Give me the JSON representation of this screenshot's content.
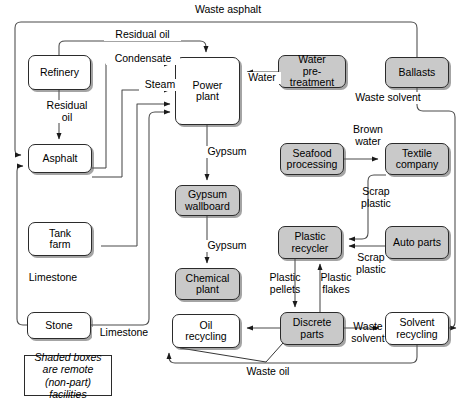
{
  "diagram": {
    "legend_text": "Shaded boxes are remote (non-part) facilities",
    "colors": {
      "shaded_fill": "#c9c9c9",
      "plain_fill": "#ffffff",
      "stroke": "#2b2b2b",
      "text": "#000000",
      "background": "#ffffff"
    },
    "nodes": [
      {
        "id": "refinery",
        "label": "Refinery",
        "shaded": false,
        "x": 28,
        "y": 55,
        "w": 63,
        "h": 35
      },
      {
        "id": "asphalt",
        "label": "Asphalt",
        "shaded": false,
        "x": 28,
        "y": 144,
        "w": 64,
        "h": 29
      },
      {
        "id": "tank_farm",
        "label": "Tank\nfarm",
        "shaded": false,
        "x": 28,
        "y": 222,
        "w": 64,
        "h": 34
      },
      {
        "id": "stone",
        "label": "Stone",
        "shaded": false,
        "x": 27,
        "y": 312,
        "w": 64,
        "h": 27
      },
      {
        "id": "power_plant",
        "label": "Power\nplant",
        "shaded": false,
        "x": 175,
        "y": 57,
        "w": 65,
        "h": 68
      },
      {
        "id": "gypsum_wallboard",
        "label": "Gypsum\nwallboard",
        "shaded": true,
        "x": 175,
        "y": 185,
        "w": 65,
        "h": 31
      },
      {
        "id": "chemical_plant",
        "label": "Chemical\nplant",
        "shaded": true,
        "x": 175,
        "y": 268,
        "w": 65,
        "h": 32
      },
      {
        "id": "oil_recycling",
        "label": "Oil\nrecycling",
        "shaded": false,
        "x": 172,
        "y": 314,
        "w": 68,
        "h": 34
      },
      {
        "id": "water_pre",
        "label": "Water\npre-treatment",
        "shaded": true,
        "x": 278,
        "y": 55,
        "w": 68,
        "h": 33
      },
      {
        "id": "ballasts",
        "label": "Ballasts",
        "shaded": true,
        "x": 385,
        "y": 57,
        "w": 64,
        "h": 31
      },
      {
        "id": "seafood",
        "label": "Seafood\nprocessing",
        "shaded": true,
        "x": 280,
        "y": 143,
        "w": 64,
        "h": 32
      },
      {
        "id": "textile",
        "label": "Textile\ncompany",
        "shaded": true,
        "x": 385,
        "y": 143,
        "w": 64,
        "h": 32
      },
      {
        "id": "plastic_rec",
        "label": "Plastic\nrecycler",
        "shaded": true,
        "x": 278,
        "y": 226,
        "w": 64,
        "h": 33
      },
      {
        "id": "auto_parts",
        "label": "Auto parts",
        "shaded": true,
        "x": 385,
        "y": 226,
        "w": 64,
        "h": 33
      },
      {
        "id": "discrete_parts",
        "label": "Discrete\nparts",
        "shaded": true,
        "x": 280,
        "y": 312,
        "w": 64,
        "h": 33
      },
      {
        "id": "solvent_rec",
        "label": "Solvent\nrecycling",
        "shaded": false,
        "x": 385,
        "y": 312,
        "w": 64,
        "h": 33
      }
    ],
    "flow_labels": [
      {
        "id": "waste_asphalt",
        "text": "Waste asphalt",
        "x": 182,
        "y": 4,
        "w": 90
      },
      {
        "id": "residual_oil_top",
        "text": "Residual oil",
        "x": 104,
        "y": 29,
        "w": 75
      },
      {
        "id": "condensate",
        "text": "Condensate",
        "x": 106,
        "y": 53,
        "w": 72
      },
      {
        "id": "steam",
        "text": "Steam",
        "x": 139,
        "y": 79,
        "w": 40
      },
      {
        "id": "water",
        "text": "Water",
        "x": 243,
        "y": 72,
        "w": 36
      },
      {
        "id": "residual_oil_v",
        "text": "Residual\noil",
        "x": 41,
        "y": 100,
        "w": 50
      },
      {
        "id": "waste_solvent_t",
        "text": "Waste solvent",
        "x": 344,
        "y": 92,
        "w": 86
      },
      {
        "id": "gypsum_1",
        "text": "Gypsum",
        "x": 202,
        "y": 146,
        "w": 48
      },
      {
        "id": "brown_water",
        "text": "Brown\nwater",
        "x": 346,
        "y": 124,
        "w": 42
      },
      {
        "id": "scrap_plastic_1",
        "text": "Scrap\nplastic",
        "x": 354,
        "y": 186,
        "w": 42
      },
      {
        "id": "scrap_plastic_2",
        "text": "Scrap\nplastic",
        "x": 349,
        "y": 252,
        "w": 42
      },
      {
        "id": "gypsum_2",
        "text": "Gypsum",
        "x": 202,
        "y": 240,
        "w": 48
      },
      {
        "id": "limestone_v",
        "text": "Limestone",
        "x": 21,
        "y": 272,
        "w": 62
      },
      {
        "id": "limestone_h",
        "text": "Limestone",
        "x": 92,
        "y": 327,
        "w": 62
      },
      {
        "id": "plastic_pellets",
        "text": "Plastic\npellets",
        "x": 262,
        "y": 272,
        "w": 44
      },
      {
        "id": "plastic_flakes",
        "text": "Plastic\nflakes",
        "x": 313,
        "y": 272,
        "w": 44
      },
      {
        "id": "waste_solvent_b",
        "text": "Waste\nsolvent",
        "x": 345,
        "y": 321,
        "w": 44
      },
      {
        "id": "waste_oil",
        "text": "Waste oil",
        "x": 237,
        "y": 366,
        "w": 60
      }
    ],
    "edges": [
      {
        "from": "ballasts",
        "to": "asphalt",
        "label": "Waste asphalt"
      },
      {
        "from": "refinery",
        "to": "power_plant",
        "label": "Residual oil"
      },
      {
        "from": "refinery",
        "to": "asphalt",
        "label": "Residual oil"
      },
      {
        "from": "power_plant",
        "to": "asphalt",
        "label": "Condensate"
      },
      {
        "from": "power_plant",
        "to": "asphalt",
        "label": "Steam"
      },
      {
        "from": "power_plant",
        "to": "tank_farm",
        "label": "Steam"
      },
      {
        "from": "water_pre",
        "to": "power_plant",
        "label": "Water"
      },
      {
        "from": "power_plant",
        "to": "gypsum_wallboard",
        "label": "Gypsum"
      },
      {
        "from": "gypsum_wallboard",
        "to": "chemical_plant",
        "label": "Gypsum"
      },
      {
        "from": "stone",
        "to": "asphalt",
        "label": "Limestone"
      },
      {
        "from": "stone",
        "to": "power_plant",
        "label": "Limestone"
      },
      {
        "from": "ballasts",
        "to": "solvent_rec",
        "label": "Waste solvent"
      },
      {
        "from": "seafood",
        "to": "textile",
        "label": "Brown water"
      },
      {
        "from": "textile",
        "to": "plastic_rec",
        "label": "Scrap plastic"
      },
      {
        "from": "auto_parts",
        "to": "plastic_rec",
        "label": "Scrap plastic"
      },
      {
        "from": "plastic_rec",
        "to": "discrete_parts",
        "label": "Plastic pellets"
      },
      {
        "from": "discrete_parts",
        "to": "plastic_rec",
        "label": "Plastic flakes"
      },
      {
        "from": "discrete_parts",
        "to": "solvent_rec",
        "label": "Waste solvent"
      },
      {
        "from": "discrete_parts",
        "to": "oil_recycling",
        "label": "Waste oil"
      },
      {
        "from": "solvent_rec",
        "to": "oil_recycling",
        "label": "Waste oil"
      }
    ],
    "legend_box": {
      "x": 24,
      "y": 355,
      "w": 88,
      "h": 41
    }
  }
}
